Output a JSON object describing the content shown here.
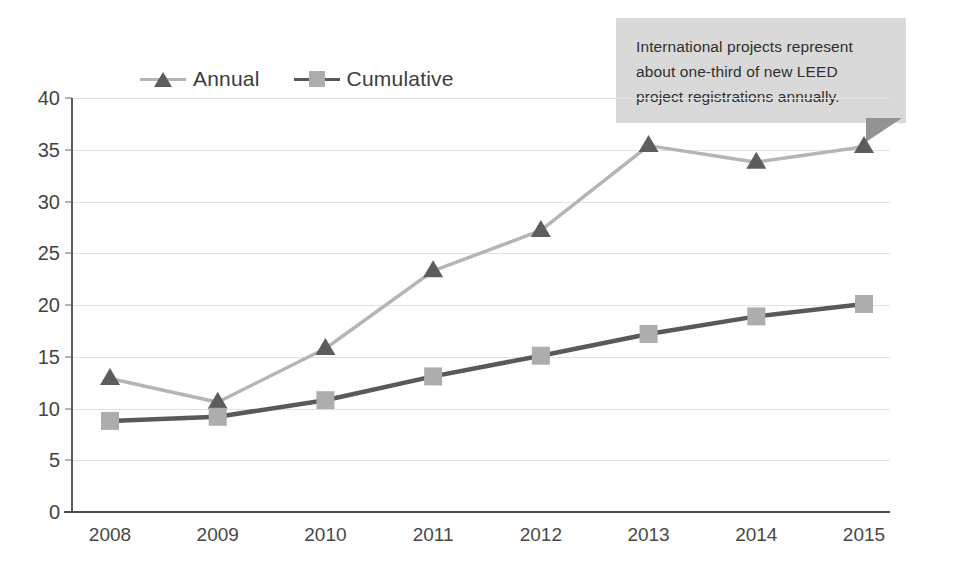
{
  "chart_data": {
    "type": "line",
    "title": "",
    "subtitle": "",
    "xlabel": "",
    "ylabel": "",
    "categories": [
      "2008",
      "2009",
      "2010",
      "2011",
      "2012",
      "2013",
      "2014",
      "2015"
    ],
    "series": [
      {
        "name": "Annual",
        "marker": "triangle",
        "line_color": "#b5b5b5",
        "marker_color": "#5d5d5d",
        "values": [
          12.9,
          10.6,
          15.8,
          23.3,
          27.2,
          35.4,
          33.8,
          35.3
        ]
      },
      {
        "name": "Cumulative",
        "marker": "square",
        "line_color": "#595959",
        "marker_color": "#adadad",
        "values": [
          8.8,
          9.2,
          10.8,
          13.1,
          15.1,
          17.2,
          18.9,
          20.1
        ]
      }
    ],
    "ylim": [
      0,
      40
    ],
    "yticks": [
      "0",
      "5",
      "10",
      "15",
      "20",
      "25",
      "30",
      "35",
      "40"
    ],
    "grid": true,
    "legend_position": "top-left"
  },
  "legend": {
    "items": [
      {
        "label": "Annual"
      },
      {
        "label": "Cumulative"
      }
    ]
  },
  "callout": {
    "text": "International projects represent about one-third of new LEED project registrations annually."
  },
  "colors": {
    "annual_line": "#b5b5b5",
    "annual_marker": "#5d5d5d",
    "cumulative_line": "#595959",
    "cumulative_marker": "#adadad",
    "grid": "#e2e2e2",
    "axis": "#4a4a4a",
    "callout_bg": "#d9d9d9",
    "callout_fold": "#939393"
  }
}
